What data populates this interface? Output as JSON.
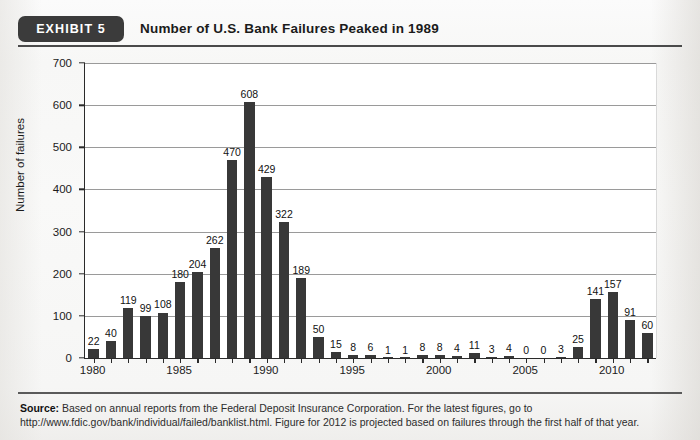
{
  "header": {
    "badge_label": "EXHIBIT 5",
    "title": "Number of U.S. Bank Failures Peaked in 1989"
  },
  "footer": {
    "source_label": "Source:",
    "source_text": " Based on annual reports from the Federal Deposit Insurance Corporation. For the latest figures, go to http://www.fdic.gov/bank/individual/failed/banklist.html. Figure for 2012 is projected based on failures through the first half of that year."
  },
  "chart_data": {
    "type": "bar",
    "title": "Number of U.S. Bank Failures Peaked in 1989",
    "xlabel": "",
    "ylabel": "Number of failures",
    "ylim": [
      0,
      700
    ],
    "ytick_values": [
      0,
      100,
      200,
      300,
      400,
      500,
      600,
      700
    ],
    "ytick_labels": [
      "0",
      "100",
      "200",
      "300",
      "400",
      "500",
      "600",
      "700"
    ],
    "grid": true,
    "legend": "none",
    "bar_color": "#383838",
    "xtick_labels": [
      "1980",
      "1985",
      "1990",
      "1995",
      "2000",
      "2005",
      "2010"
    ],
    "categories": [
      "1980",
      "1981",
      "1982",
      "1983",
      "1984",
      "1985",
      "1986",
      "1987",
      "1988",
      "1989",
      "1990",
      "1991",
      "1992",
      "1993",
      "1994",
      "1995",
      "1996",
      "1997",
      "1998",
      "1999",
      "2000",
      "2001",
      "2002",
      "2003",
      "2004",
      "2005",
      "2006",
      "2007",
      "2008",
      "2009",
      "2010",
      "2011",
      "2012"
    ],
    "values": [
      22,
      40,
      119,
      99,
      108,
      180,
      204,
      262,
      470,
      608,
      429,
      322,
      189,
      50,
      15,
      8,
      6,
      1,
      1,
      8,
      8,
      4,
      11,
      3,
      4,
      0,
      0,
      3,
      25,
      141,
      157,
      91,
      60
    ],
    "data_labels": [
      "22",
      "40",
      "119",
      "99",
      "108",
      "180",
      "204",
      "262",
      "470",
      "608",
      "429",
      "322",
      "189",
      "50",
      "15",
      "8",
      "6",
      "1",
      "1",
      "8",
      "8",
      "4",
      "11",
      "3",
      "4",
      "0",
      "0",
      "3",
      "25",
      "141",
      "157",
      "91",
      "60"
    ]
  }
}
